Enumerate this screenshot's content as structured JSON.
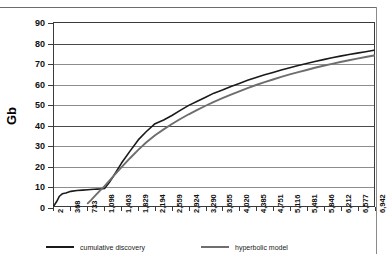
{
  "chart_data": {
    "type": "line",
    "title": "",
    "xlabel": "",
    "ylabel": "Gb",
    "ylim": [
      0,
      90
    ],
    "ytick_step": 10,
    "grid": true,
    "legend_position": "bottom",
    "yticks": [
      "0",
      "10",
      "20",
      "30",
      "40",
      "50",
      "60",
      "70",
      "80",
      "90"
    ],
    "categories": [
      "2",
      "368",
      "733",
      "1,098",
      "1,463",
      "1,829",
      "2,194",
      "2,559",
      "2,924",
      "3,290",
      "3,655",
      "4,020",
      "4,385",
      "4,751",
      "5,116",
      "5,481",
      "5,846",
      "6,212",
      "6,577",
      "6,942"
    ],
    "series": [
      {
        "name": "cumulative discovery",
        "color": "#1a1a1a",
        "x": [
          2,
          60,
          120,
          180,
          260,
          368,
          500,
          620,
          733,
          800,
          870,
          940,
          1010,
          1098,
          1200,
          1300,
          1463,
          1650,
          1829,
          2000,
          2194,
          2380,
          2559,
          2740,
          2924,
          3110,
          3290,
          3470,
          3655,
          3840,
          4020,
          4200,
          4385,
          4570,
          4751,
          4930,
          5116,
          5300,
          5481,
          5660,
          5846,
          6030,
          6212,
          6400,
          6577,
          6760,
          6942
        ],
        "values": [
          0.2,
          2.2,
          4.8,
          6.0,
          6.4,
          7.2,
          7.6,
          7.8,
          8.0,
          8.1,
          8.2,
          8.3,
          8.4,
          8.6,
          11.5,
          15.0,
          21.0,
          27.0,
          32.5,
          36.5,
          40.5,
          42.3,
          44.5,
          47.0,
          49.5,
          51.5,
          53.5,
          55.5,
          57.0,
          58.8,
          60.3,
          61.8,
          63.2,
          64.5,
          65.7,
          66.9,
          68.0,
          69.1,
          70.1,
          71.1,
          72.0,
          72.9,
          73.7,
          74.5,
          75.2,
          75.9,
          76.6
        ]
      },
      {
        "name": "hyperbolic model",
        "color": "#6e6e6e",
        "x": [
          733,
          800,
          900,
          1000,
          1098,
          1200,
          1300,
          1463,
          1650,
          1829,
          2000,
          2194,
          2380,
          2559,
          2740,
          2924,
          3110,
          3290,
          3470,
          3655,
          3840,
          4020,
          4200,
          4385,
          4570,
          4751,
          4930,
          5116,
          5300,
          5481,
          5660,
          5846,
          6030,
          6212,
          6400,
          6577,
          6760,
          6942
        ],
        "values": [
          1.3,
          2.8,
          5.2,
          7.6,
          9.8,
          12.4,
          14.9,
          19.0,
          23.5,
          27.6,
          31.2,
          34.8,
          37.7,
          40.3,
          42.8,
          45.1,
          47.3,
          49.3,
          51.2,
          53.0,
          54.8,
          56.4,
          58.0,
          59.5,
          60.9,
          62.2,
          63.5,
          64.7,
          65.8,
          66.9,
          68.0,
          69.0,
          69.9,
          70.8,
          71.7,
          72.5,
          73.3,
          74.0
        ]
      }
    ]
  },
  "legend": {
    "entries": [
      {
        "label": "cumulative discovery"
      },
      {
        "label": "hyperbolic model"
      }
    ]
  }
}
